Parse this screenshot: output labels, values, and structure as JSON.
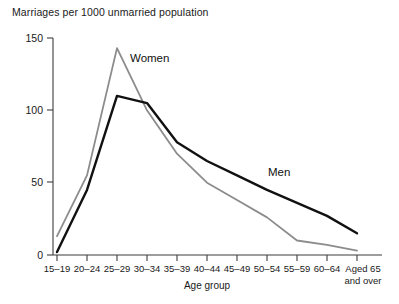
{
  "chart_data": {
    "type": "line",
    "title": "Marriages per 1000 unmarried population",
    "xlabel": "Age group",
    "ylabel": "",
    "ylim": [
      0,
      150
    ],
    "yticks": [
      0,
      50,
      100,
      150
    ],
    "ytick_labels": [
      "0",
      "50",
      "100",
      "150"
    ],
    "grid": false,
    "legend_position": "inline-annotation",
    "categories": [
      "15–19",
      "20–24",
      "25–29",
      "30–34",
      "35–39",
      "40–44",
      "45–49",
      "50–54",
      "55–59",
      "60–64",
      "Aged 65 and over"
    ],
    "category_labels_multiline": {
      "10": [
        "Aged 65",
        "and over"
      ]
    },
    "series": [
      {
        "name": "Women",
        "color": "#8c8c8c",
        "values": [
          13,
          55,
          143,
          100,
          70,
          50,
          38,
          26,
          10,
          7,
          3
        ]
      },
      {
        "name": "Men",
        "color": "#111111",
        "values": [
          2,
          45,
          110,
          105,
          78,
          65,
          55,
          45,
          36,
          27,
          15
        ]
      }
    ],
    "annotations": [
      {
        "text": "Women",
        "series": "Women",
        "x_px": 130,
        "y_px": 62
      },
      {
        "text": "Men",
        "series": "Men",
        "x_px": 268,
        "y_px": 176
      }
    ]
  },
  "axis": {
    "y_tick_0": "0",
    "y_tick_50": "50",
    "y_tick_100": "100",
    "y_tick_150": "150",
    "x_title": "Age group"
  },
  "labels": {
    "women": "Women",
    "men": "Men",
    "title": "Marriages per 1000 unmarried population",
    "cat0": "15–19",
    "cat1": "20–24",
    "cat2": "25–29",
    "cat3": "30–34",
    "cat4": "35–39",
    "cat5": "40–44",
    "cat6": "45–49",
    "cat7": "50–54",
    "cat8": "55–59",
    "cat9": "60–64",
    "cat10_line1": "Aged 65",
    "cat10_line2": "and over"
  }
}
